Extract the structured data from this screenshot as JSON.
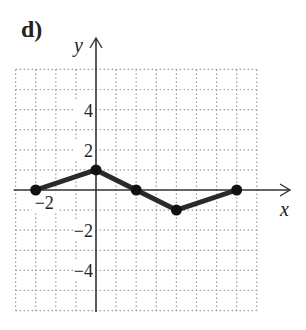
{
  "part_label": "d)",
  "chart_data": {
    "type": "line",
    "title": "",
    "xlabel": "x",
    "ylabel": "y",
    "xlim": [
      -4,
      8
    ],
    "ylim": [
      -6,
      6
    ],
    "grid": true,
    "grid_step": 1,
    "x_ticks_labeled": [
      {
        "value": -2,
        "label": "−2"
      }
    ],
    "y_ticks_labeled": [
      {
        "value": 4,
        "label": "4"
      },
      {
        "value": 2,
        "label": "2"
      },
      {
        "value": -2,
        "label": "−2"
      },
      {
        "value": -4,
        "label": "−4"
      }
    ],
    "series": [
      {
        "name": "piecewise",
        "points": [
          [
            -3,
            0
          ],
          [
            0,
            1
          ],
          [
            2,
            0
          ],
          [
            4,
            -1
          ],
          [
            7,
            0
          ]
        ],
        "marker": "filled-circle",
        "color": "#1a1a1a"
      }
    ]
  },
  "colors": {
    "axis": "#333333",
    "grid": "#9a9a9a",
    "line": "#2a2a2a",
    "point": "#111111",
    "text": "#222222"
  }
}
